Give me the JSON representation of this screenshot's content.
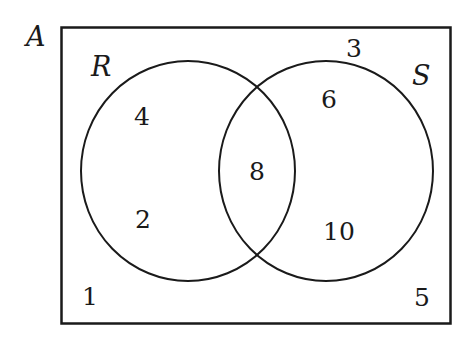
{
  "diagram": {
    "type": "venn",
    "universal_set": {
      "label": "A",
      "outside_value": "1",
      "outside_value_2": "3",
      "outside_value_3": "5"
    },
    "sets": [
      {
        "label": "R",
        "only_values": [
          "4",
          "2"
        ]
      },
      {
        "label": "S",
        "only_values": [
          "6",
          "10"
        ]
      }
    ],
    "intersection": {
      "values": [
        "8"
      ]
    },
    "colors": {
      "stroke": "#1a1a1a",
      "background": "#ffffff"
    }
  }
}
